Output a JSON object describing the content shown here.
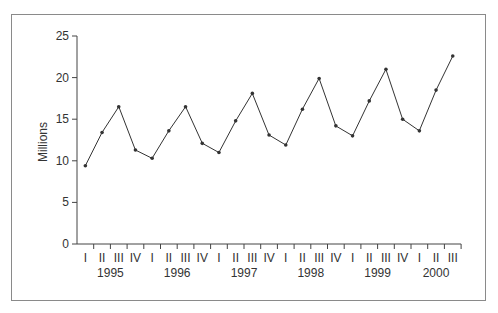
{
  "chart_data": {
    "type": "line",
    "title": "",
    "xlabel": "",
    "ylabel": "Millions",
    "ylim": [
      0,
      25
    ],
    "yticks": [
      0,
      5,
      10,
      15,
      20,
      25
    ],
    "grid": false,
    "legend": null,
    "categories": [
      "1995 I",
      "1995 II",
      "1995 III",
      "1995 IV",
      "1996 I",
      "1996 II",
      "1996 III",
      "1996 IV",
      "1997 I",
      "1997 II",
      "1997 III",
      "1997 IV",
      "1998 I",
      "1998 II",
      "1998 III",
      "1998 IV",
      "1999 I",
      "1999 II",
      "1999 III",
      "1999 IV",
      "2000 I",
      "2000 II",
      "2000 III"
    ],
    "quarter_labels": [
      "I",
      "II",
      "III",
      "IV",
      "I",
      "II",
      "III",
      "IV",
      "I",
      "II",
      "III",
      "IV",
      "I",
      "II",
      "III",
      "IV",
      "I",
      "II",
      "III",
      "IV",
      "I",
      "II",
      "III"
    ],
    "year_labels": [
      {
        "label": "1995",
        "start": 0,
        "count": 4
      },
      {
        "label": "1996",
        "start": 4,
        "count": 4
      },
      {
        "label": "1997",
        "start": 8,
        "count": 4
      },
      {
        "label": "1998",
        "start": 12,
        "count": 4
      },
      {
        "label": "1999",
        "start": 16,
        "count": 4
      },
      {
        "label": "2000",
        "start": 20,
        "count": 3
      }
    ],
    "series": [
      {
        "name": "Quarterly value",
        "values": [
          9.4,
          13.4,
          16.5,
          11.3,
          10.3,
          13.6,
          16.5,
          12.1,
          11.0,
          14.8,
          18.1,
          13.1,
          11.9,
          16.2,
          19.9,
          14.2,
          13.0,
          17.2,
          21.0,
          15.0,
          13.6,
          18.5,
          22.6
        ],
        "color": "#333333",
        "markers": true
      }
    ]
  },
  "colors": {
    "frame_border": "#8a8a8a",
    "axis": "#444444",
    "line": "#333333",
    "text": "#333333"
  }
}
